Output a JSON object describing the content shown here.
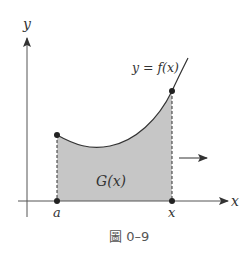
{
  "diagram": {
    "y_axis_label": "y",
    "x_axis_label": "x",
    "curve_label": "y = f(x)",
    "curve_label_parts": {
      "lhs": "y",
      "eq": "=",
      "rhs": "f(x)"
    },
    "area_label": "G(x)",
    "point_a_label": "a",
    "point_x_label": "x",
    "caption": "圖 0–9",
    "colors": {
      "shade": "#c4c4c4",
      "line": "#333333",
      "axis": "#555555"
    }
  }
}
